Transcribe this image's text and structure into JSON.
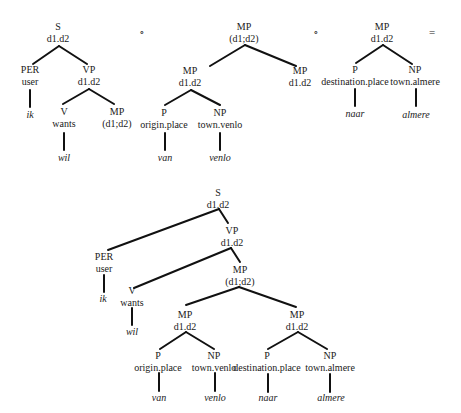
{
  "diagram": {
    "colors": {
      "line": "#111111",
      "text": "#1a1a1a",
      "background": "#ffffff"
    },
    "operators": [
      {
        "symbol": "∘",
        "x": 142,
        "y": 36
      },
      {
        "symbol": "∘",
        "x": 316,
        "y": 36
      },
      {
        "symbol": "=",
        "x": 432,
        "y": 36
      }
    ],
    "trees": [
      {
        "id": "tree-s",
        "nodes": [
          {
            "id": "s",
            "cat": "S",
            "feat": "d1.d2",
            "x": 58,
            "y": 30
          },
          {
            "id": "per",
            "cat": "PER",
            "feat": "user",
            "x": 30,
            "y": 73
          },
          {
            "id": "vp",
            "cat": "VP",
            "feat": "d1.d2",
            "x": 89,
            "y": 73
          },
          {
            "id": "ik",
            "word": "ik",
            "x": 30,
            "y": 118
          },
          {
            "id": "v",
            "cat": "V",
            "feat": "wants",
            "x": 64,
            "y": 115
          },
          {
            "id": "mp",
            "cat": "MP",
            "feat": "(d1;d2)",
            "x": 117,
            "y": 115
          },
          {
            "id": "wil",
            "word": "wil",
            "x": 64,
            "y": 161
          }
        ],
        "edges": [
          [
            59,
            46,
            33,
            64
          ],
          [
            59,
            46,
            87,
            64
          ],
          [
            30,
            90,
            30,
            107
          ],
          [
            89,
            89,
            63,
            104
          ],
          [
            89,
            89,
            114,
            104
          ],
          [
            64,
            133,
            64,
            150
          ]
        ]
      },
      {
        "id": "tree-mp-1",
        "nodes": [
          {
            "id": "mp0",
            "cat": "MP",
            "feat": "(d1;d2)",
            "x": 244,
            "y": 30
          },
          {
            "id": "mp1",
            "cat": "MP",
            "feat": "d1.d2",
            "x": 190,
            "y": 74
          },
          {
            "id": "mp2",
            "cat": "MP",
            "feat": "d1.d2",
            "x": 300,
            "y": 74
          },
          {
            "id": "p",
            "cat": "P",
            "feat": "origin.place",
            "x": 164,
            "y": 116
          },
          {
            "id": "np",
            "cat": "NP",
            "feat": "town.venlo",
            "x": 220,
            "y": 116
          },
          {
            "id": "van",
            "word": "van",
            "x": 165,
            "y": 161
          },
          {
            "id": "venlo",
            "word": "venlo",
            "x": 220,
            "y": 161
          }
        ],
        "edges": [
          [
            245,
            45,
            210,
            66
          ],
          [
            245,
            45,
            296,
            66
          ],
          [
            191,
            90,
            165,
            105
          ],
          [
            191,
            90,
            220,
            105
          ],
          [
            165,
            133,
            165,
            150
          ],
          [
            220,
            133,
            220,
            150
          ]
        ]
      },
      {
        "id": "tree-mp-2",
        "nodes": [
          {
            "id": "mp",
            "cat": "MP",
            "feat": "d1.d2",
            "x": 382,
            "y": 30
          },
          {
            "id": "p",
            "cat": "P",
            "feat": "destination.place",
            "x": 355,
            "y": 73
          },
          {
            "id": "np",
            "cat": "NP",
            "feat": "town.almere",
            "x": 415,
            "y": 73
          },
          {
            "id": "naar",
            "word": "naar",
            "x": 355,
            "y": 117
          },
          {
            "id": "almere",
            "word": "almere",
            "x": 416,
            "y": 118
          }
        ],
        "edges": [
          [
            383,
            45,
            356,
            63
          ],
          [
            383,
            45,
            412,
            64
          ],
          [
            355,
            89,
            355,
            106
          ],
          [
            416,
            89,
            416,
            106
          ]
        ]
      },
      {
        "id": "tree-result",
        "nodes": [
          {
            "id": "s",
            "cat": "S",
            "feat": "d1.d2",
            "x": 218,
            "y": 196
          },
          {
            "id": "vp",
            "cat": "VP",
            "feat": "d1.d2",
            "x": 232,
            "y": 234
          },
          {
            "id": "per",
            "cat": "PER",
            "feat": "user",
            "x": 104,
            "y": 260
          },
          {
            "id": "mp",
            "cat": "MP",
            "feat": "(d1;d2)",
            "x": 240,
            "y": 273
          },
          {
            "id": "ik",
            "word": "ik",
            "x": 103,
            "y": 302
          },
          {
            "id": "v",
            "cat": "V",
            "feat": "wants",
            "x": 132,
            "y": 294
          },
          {
            "id": "wil",
            "word": "wil",
            "x": 132,
            "y": 335
          },
          {
            "id": "mp1",
            "cat": "MP",
            "feat": "d1.d2",
            "x": 185,
            "y": 318
          },
          {
            "id": "mp2",
            "cat": "MP",
            "feat": "d1.d2",
            "x": 297,
            "y": 318
          },
          {
            "id": "p1",
            "cat": "P",
            "feat": "origin.place",
            "x": 158,
            "y": 359
          },
          {
            "id": "np1",
            "cat": "NP",
            "feat": "town.venlo",
            "x": 214,
            "y": 359
          },
          {
            "id": "p2",
            "cat": "P",
            "feat": "destination.place",
            "x": 267,
            "y": 359
          },
          {
            "id": "np2",
            "cat": "NP",
            "feat": "town.almere",
            "x": 330,
            "y": 359
          },
          {
            "id": "van",
            "word": "van",
            "x": 159,
            "y": 401
          },
          {
            "id": "venlo",
            "word": "venlo",
            "x": 215,
            "y": 401
          },
          {
            "id": "naar",
            "word": "naar",
            "x": 268,
            "y": 401
          },
          {
            "id": "almere",
            "word": "almere",
            "x": 331,
            "y": 401
          }
        ],
        "edges": [
          [
            219,
            209,
            108,
            250
          ],
          [
            219,
            209,
            228,
            223
          ],
          [
            104,
            275,
            104,
            292
          ],
          [
            231,
            248,
            134,
            288
          ],
          [
            231,
            248,
            240,
            262
          ],
          [
            132,
            308,
            132,
            325
          ],
          [
            239,
            287,
            186,
            305
          ],
          [
            239,
            287,
            296,
            307
          ],
          [
            186,
            332,
            160,
            349
          ],
          [
            186,
            332,
            214,
            349
          ],
          [
            298,
            332,
            268,
            349
          ],
          [
            298,
            332,
            327,
            349
          ],
          [
            159,
            373,
            159,
            391
          ],
          [
            215,
            373,
            215,
            391
          ],
          [
            268,
            374,
            268,
            392
          ],
          [
            330,
            374,
            330,
            392
          ]
        ]
      }
    ]
  }
}
